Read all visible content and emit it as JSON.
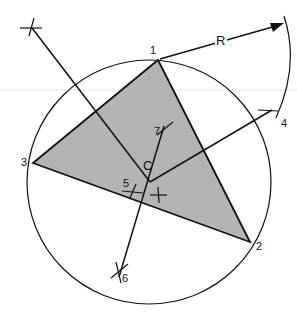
{
  "diagram": {
    "fill_color": "#b4b4b4",
    "stroke_color": "#111111",
    "vertices": [
      {
        "label": "1",
        "x": 158,
        "y": 60
      },
      {
        "label": "2",
        "x": 250,
        "y": 242
      },
      {
        "label": "3",
        "x": 33,
        "y": 163
      }
    ],
    "center": {
      "label": "C",
      "x": 150,
      "y": 182
    },
    "radius_label": "R",
    "construction_marks": [
      {
        "label": "4",
        "x": 266,
        "y": 113
      },
      {
        "label": "5",
        "x": 132,
        "y": 189
      },
      {
        "label": "6",
        "x": 120,
        "y": 277
      },
      {
        "label": "7",
        "x": 163,
        "y": 127
      }
    ]
  }
}
